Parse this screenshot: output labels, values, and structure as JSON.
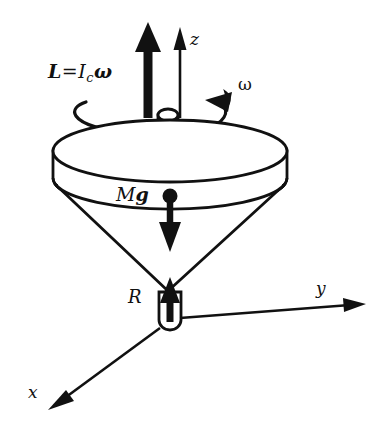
{
  "figure": {
    "background_color": "#ffffff",
    "ink_color": "#111111",
    "labels": {
      "angular_momentum": {
        "L": "L",
        "equals": "=",
        "I": "I",
        "I_subscript": "c",
        "omega": "ω",
        "full_text": "L = I_c ω"
      },
      "z_axis": "z",
      "y_axis": "y",
      "x_axis": "x",
      "spin_rate": "ω",
      "weight": {
        "M": "M",
        "g": "g",
        "full_text": "Mg"
      },
      "reaction": "R"
    },
    "elements": [
      {
        "name": "angular-momentum-arrow",
        "type": "thick-arrow",
        "direction": "up"
      },
      {
        "name": "z-axis-arrow",
        "type": "thin-arrow",
        "direction": "up"
      },
      {
        "name": "spin-arc-arrow",
        "type": "curved-arrow",
        "direction": "counterclockwise"
      },
      {
        "name": "top-shaft",
        "type": "cylinder"
      },
      {
        "name": "top-disk",
        "type": "cylinder"
      },
      {
        "name": "top-cone",
        "type": "cone"
      },
      {
        "name": "center-of-mass-dot",
        "type": "filled-dot"
      },
      {
        "name": "weight-arrow",
        "type": "thick-arrow",
        "direction": "down"
      },
      {
        "name": "reaction-arrow",
        "type": "thick-arrow",
        "direction": "up"
      },
      {
        "name": "pivot-tip",
        "type": "capsule"
      },
      {
        "name": "y-axis-arrow",
        "type": "thin-arrow",
        "direction": "right"
      },
      {
        "name": "x-axis-arrow",
        "type": "thin-arrow",
        "direction": "down-left"
      }
    ]
  }
}
